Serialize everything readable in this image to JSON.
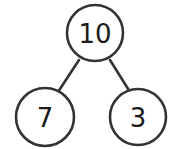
{
  "diagram": {
    "type": "number-bond",
    "whole": {
      "value": "10",
      "cx": 95,
      "cy": 33,
      "r": 28
    },
    "parts": [
      {
        "value": "7",
        "cx": 45,
        "cy": 117,
        "r": 29
      },
      {
        "value": "3",
        "cx": 138,
        "cy": 117,
        "r": 28
      }
    ],
    "edges": [
      {
        "from": "whole",
        "to": "parts.0",
        "x1": 79,
        "y1": 60,
        "x2": 58,
        "y2": 92
      },
      {
        "from": "whole",
        "to": "parts.1",
        "x1": 110,
        "y1": 60,
        "x2": 130,
        "y2": 92
      }
    ],
    "colors": {
      "stroke": "#333333",
      "text": "#1a1a1a",
      "background": "#ffffff"
    }
  }
}
